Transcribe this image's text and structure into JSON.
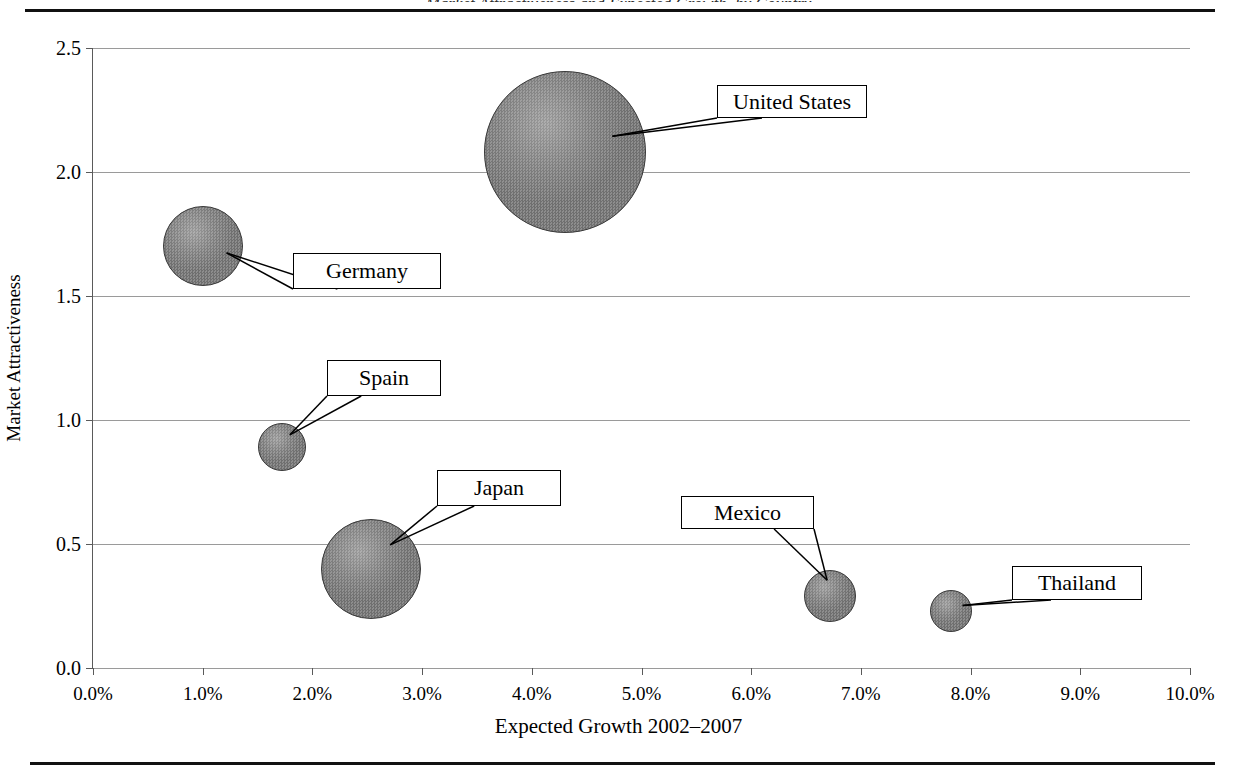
{
  "figure": {
    "clipped_title_fragment": "Market Attractiveness and Expected Growth, by Country",
    "top_rule": true,
    "bottom_rule": true
  },
  "chart_data": {
    "type": "scatter",
    "title": "",
    "xlabel": "Expected Growth 2002–2007",
    "ylabel": "Market Attractiveness",
    "xlim": [
      0,
      10
    ],
    "ylim": [
      0.0,
      2.5
    ],
    "grid": true,
    "legend": "none",
    "x_tick_labels": [
      "0.0%",
      "1.0%",
      "2.0%",
      "3.0%",
      "4.0%",
      "5.0%",
      "6.0%",
      "7.0%",
      "8.0%",
      "9.0%",
      "10.0%"
    ],
    "x_ticks": [
      0,
      1,
      2,
      3,
      4,
      5,
      6,
      7,
      8,
      9,
      10
    ],
    "y_tick_labels": [
      "0.0",
      "0.5",
      "1.0",
      "1.5",
      "2.0",
      "2.5"
    ],
    "y_ticks": [
      0.0,
      0.5,
      1.0,
      1.5,
      2.0,
      2.5
    ],
    "bubble_color": "#7d7d7d",
    "points": [
      {
        "label": "United States",
        "x": 4.3,
        "y": 2.08,
        "r_px": 81
      },
      {
        "label": "Germany",
        "x": 1.0,
        "y": 1.7,
        "r_px": 40
      },
      {
        "label": "Spain",
        "x": 1.72,
        "y": 0.89,
        "r_px": 24
      },
      {
        "label": "Japan",
        "x": 2.53,
        "y": 0.4,
        "r_px": 50
      },
      {
        "label": "Mexico",
        "x": 6.72,
        "y": 0.29,
        "r_px": 26
      },
      {
        "label": "Thailand",
        "x": 7.82,
        "y": 0.23,
        "r_px": 21
      }
    ],
    "callouts": [
      {
        "label": "United States",
        "x": 717,
        "y": 85,
        "w": 150,
        "h": 33
      },
      {
        "label": "Germany",
        "x": 293,
        "y": 253,
        "w": 148,
        "h": 36
      },
      {
        "label": "Spain",
        "x": 327,
        "y": 360,
        "w": 114,
        "h": 36
      },
      {
        "label": "Japan",
        "x": 437,
        "y": 470,
        "w": 124,
        "h": 36
      },
      {
        "label": "Mexico",
        "x": 681,
        "y": 496,
        "w": 133,
        "h": 33
      },
      {
        "label": "Thailand",
        "x": 1012,
        "y": 566,
        "w": 130,
        "h": 34
      }
    ]
  }
}
